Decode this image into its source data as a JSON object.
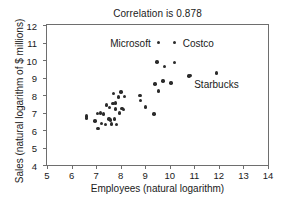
{
  "chart_data": {
    "type": "scatter",
    "title": "Correlation is 0.878",
    "xlabel": "Employees (natural logarithm)",
    "ylabel": "Sales (natural logarithm of $ millions)",
    "xlim": [
      5,
      14
    ],
    "ylim": [
      4,
      12
    ],
    "xticks": [
      5,
      6,
      7,
      8,
      9,
      10,
      11,
      12,
      13,
      14
    ],
    "yticks": [
      4,
      5,
      6,
      7,
      8,
      9,
      10,
      11,
      12
    ],
    "grid": false,
    "legend": false,
    "correlation": 0.878,
    "marker_color": "#2b2b2b",
    "axis_color": "#6e6e6e",
    "points": [
      [
        6.6,
        6.8
      ],
      [
        6.62,
        6.68
      ],
      [
        6.95,
        6.52
      ],
      [
        7.05,
        6.95
      ],
      [
        7.08,
        6.1
      ],
      [
        7.18,
        6.98
      ],
      [
        7.22,
        6.38
      ],
      [
        7.3,
        6.92
      ],
      [
        7.38,
        6.3
      ],
      [
        7.42,
        7.42
      ],
      [
        7.52,
        6.62
      ],
      [
        7.55,
        7.28
      ],
      [
        7.58,
        6.58
      ],
      [
        7.62,
        6.35
      ],
      [
        7.68,
        7.5
      ],
      [
        7.72,
        8.1
      ],
      [
        7.74,
        6.62
      ],
      [
        7.78,
        7.2
      ],
      [
        7.8,
        7.55
      ],
      [
        7.82,
        6.3
      ],
      [
        7.9,
        7.88
      ],
      [
        7.95,
        6.98
      ],
      [
        8.02,
        8.18
      ],
      [
        8.05,
        7.22
      ],
      [
        8.12,
        7.18
      ],
      [
        8.15,
        7.92
      ],
      [
        8.78,
        7.98
      ],
      [
        8.8,
        7.7
      ],
      [
        9.0,
        7.32
      ],
      [
        9.35,
        6.92
      ],
      [
        9.4,
        8.62
      ],
      [
        9.48,
        9.88
      ],
      [
        9.55,
        8.22
      ],
      [
        9.72,
        8.8
      ],
      [
        9.78,
        9.62
      ],
      [
        10.05,
        8.68
      ],
      [
        10.18,
        9.85
      ],
      [
        10.78,
        9.08
      ],
      [
        10.85,
        9.12
      ],
      [
        9.55,
        11.0
      ],
      [
        10.2,
        11.0
      ],
      [
        11.9,
        9.25
      ]
    ],
    "annotations": [
      {
        "label": "Microsoft",
        "x": 9.55,
        "y": 11.0,
        "anchor": "right",
        "offset_px": 8
      },
      {
        "label": "Costco",
        "x": 10.2,
        "y": 11.0,
        "anchor": "left",
        "offset_px": 8
      },
      {
        "label": "Starbucks",
        "x": 11.9,
        "y": 9.25,
        "anchor": "below",
        "offset_px": 6
      }
    ]
  }
}
